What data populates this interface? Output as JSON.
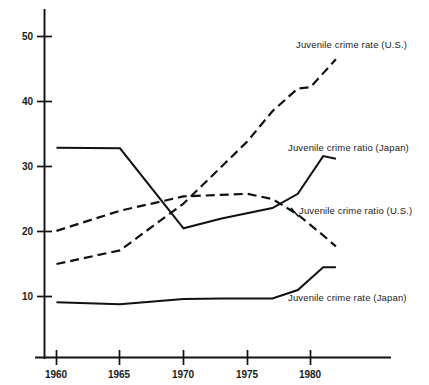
{
  "chart_data": {
    "type": "line",
    "title": "",
    "subtitle": "",
    "xlabel": "",
    "ylabel": "",
    "xlim": [
      1958.6,
      1983.5
    ],
    "ylim": [
      0,
      55
    ],
    "xticks": [
      1960,
      1965,
      1970,
      1975,
      1980
    ],
    "xtick_labels": [
      "1960",
      "1965",
      "1970",
      "1975",
      "1980"
    ],
    "yticks": [
      10,
      20,
      30,
      40,
      50
    ],
    "ytick_labels": [
      "10",
      "20",
      "30",
      "40",
      "50"
    ],
    "grid": false,
    "legend_position": "inline-annotations",
    "series": [
      {
        "name": "Juvenile crime rate (U.S.)",
        "style": "dashed",
        "label_position": "upper-right",
        "x": [
          1960,
          1965,
          1970,
          1975,
          1977,
          1979,
          1980,
          1982
        ],
        "values": [
          15.0,
          17.1,
          24.3,
          33.8,
          38.5,
          42.0,
          42.2,
          46.5
        ]
      },
      {
        "name": "Juvenile crime ratio (Japan)",
        "style": "solid",
        "label_position": "middle-right",
        "x": [
          1960,
          1965,
          1970,
          1973,
          1975,
          1977,
          1979,
          1981,
          1982
        ],
        "values": [
          32.9,
          32.8,
          20.5,
          22.0,
          22.8,
          23.6,
          25.8,
          31.6,
          31.2
        ]
      },
      {
        "name": "Juvenile crime ratio (U.S.)",
        "style": "dashed",
        "label_position": "right",
        "x": [
          1960,
          1965,
          1970,
          1975,
          1977,
          1979,
          1981,
          1982
        ],
        "values": [
          20.1,
          23.2,
          25.4,
          25.8,
          25.0,
          22.6,
          19.4,
          17.7
        ]
      },
      {
        "name": "Juvenile crime rate (Japan)",
        "style": "solid",
        "label_position": "lower-right",
        "x": [
          1960,
          1965,
          1970,
          1973,
          1977,
          1979,
          1981,
          1982
        ],
        "values": [
          9.1,
          8.8,
          9.6,
          9.7,
          9.7,
          11.0,
          14.5,
          14.5
        ]
      }
    ],
    "annotations": [
      {
        "text": "Juvenile crime rate (U.S.)",
        "x": 296,
        "y": 48,
        "leader": false
      },
      {
        "text": "Juvenile crime ratio (Japan)",
        "x": 288,
        "y": 151,
        "leader": false
      },
      {
        "text": "Juvenile crime ratio (U.S.)",
        "x": 299,
        "y": 214,
        "leader": false
      },
      {
        "text": "Juvenile crime rate (Japan)",
        "x": 288,
        "y": 301,
        "leader": false
      }
    ],
    "colors": {
      "background": "#ffffff",
      "axis": "#111111",
      "series": "#111111",
      "text": "#1a1a1a"
    }
  }
}
